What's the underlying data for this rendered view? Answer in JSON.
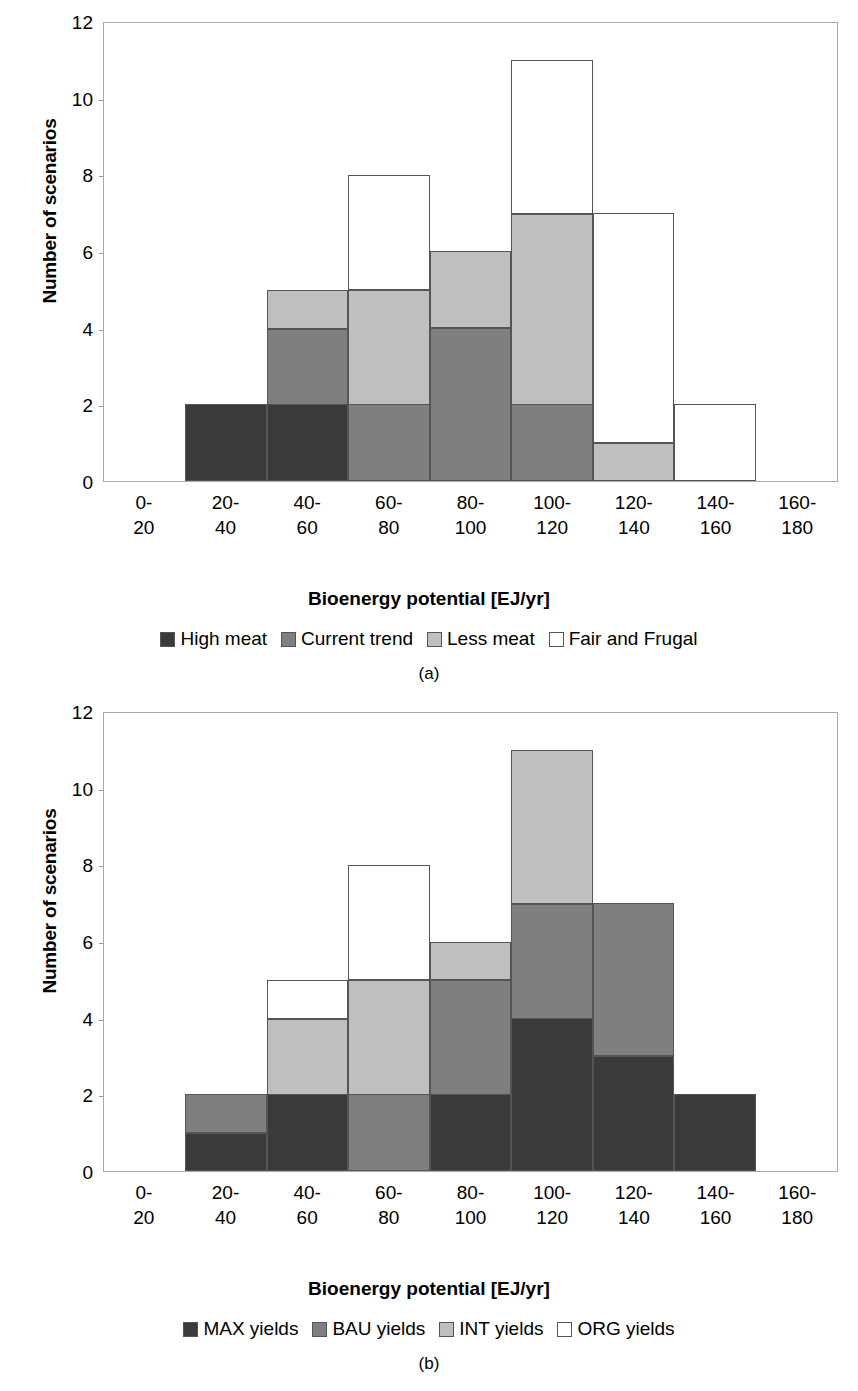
{
  "figures": [
    {
      "id": "a",
      "caption": "(a)",
      "ylabel": "Number of scenarios",
      "xlabel": "Bioenergy potential [EJ/yr]",
      "yticks": [
        "0",
        "2",
        "4",
        "6",
        "8",
        "10",
        "12"
      ],
      "categories": [
        "0-\n20",
        "20-\n40",
        "40-\n60",
        "60-\n80",
        "80-\n100",
        "100-\n120",
        "120-\n140",
        "140-\n160",
        "160-\n180"
      ],
      "legend": [
        {
          "label": "High meat",
          "color": "#3a3a3a"
        },
        {
          "label": "Current trend",
          "color": "#7f7f7f"
        },
        {
          "label": "Less meat",
          "color": "#bfbfbf"
        },
        {
          "label": "Fair and Frugal",
          "color": "#ffffff"
        }
      ]
    },
    {
      "id": "b",
      "caption": "(b)",
      "ylabel": "Number of scenarios",
      "xlabel": "Bioenergy potential [EJ/yr]",
      "yticks": [
        "0",
        "2",
        "4",
        "6",
        "8",
        "10",
        "12"
      ],
      "categories": [
        "0-\n20",
        "20-\n40",
        "40-\n60",
        "60-\n80",
        "80-\n100",
        "100-\n120",
        "120-\n140",
        "140-\n160",
        "160-\n180"
      ],
      "legend": [
        {
          "label": "MAX yields",
          "color": "#3a3a3a"
        },
        {
          "label": "BAU yields",
          "color": "#7f7f7f"
        },
        {
          "label": "INT yields",
          "color": "#bfbfbf"
        },
        {
          "label": "ORG yields",
          "color": "#ffffff"
        }
      ]
    }
  ],
  "chart_data": [
    {
      "type": "bar",
      "title": "(a)",
      "stacked": true,
      "xlabel": "Bioenergy potential [EJ/yr]",
      "ylabel": "Number of scenarios",
      "ylim": [
        0,
        12
      ],
      "ytick_step": 2,
      "grid": false,
      "legend_position": "bottom",
      "categories": [
        "0-20",
        "20-40",
        "40-60",
        "60-80",
        "80-100",
        "100-120",
        "120-140",
        "140-160",
        "160-180"
      ],
      "series": [
        {
          "name": "High meat",
          "color": "#3a3a3a",
          "values": [
            0,
            2,
            2,
            0,
            0,
            0,
            0,
            0,
            0
          ]
        },
        {
          "name": "Current trend",
          "color": "#7f7f7f",
          "values": [
            0,
            0,
            2,
            2,
            4,
            2,
            0,
            0,
            0
          ]
        },
        {
          "name": "Less meat",
          "color": "#bfbfbf",
          "values": [
            0,
            0,
            1,
            3,
            2,
            5,
            1,
            0,
            0
          ]
        },
        {
          "name": "Fair and Frugal",
          "color": "#ffffff",
          "values": [
            0,
            0,
            0,
            3,
            0,
            4,
            6,
            2,
            0
          ]
        }
      ],
      "totals": [
        0,
        2,
        5,
        8,
        6,
        11,
        7,
        2,
        0
      ]
    },
    {
      "type": "bar",
      "title": "(b)",
      "stacked": true,
      "xlabel": "Bioenergy potential [EJ/yr]",
      "ylabel": "Number of scenarios",
      "ylim": [
        0,
        12
      ],
      "ytick_step": 2,
      "grid": false,
      "legend_position": "bottom",
      "categories": [
        "0-20",
        "20-40",
        "40-60",
        "60-80",
        "80-100",
        "100-120",
        "120-140",
        "140-160",
        "160-180"
      ],
      "series": [
        {
          "name": "MAX yields",
          "color": "#3a3a3a",
          "values": [
            0,
            1,
            2,
            0,
            2,
            4,
            3,
            2,
            0
          ]
        },
        {
          "name": "BAU yields",
          "color": "#7f7f7f",
          "values": [
            0,
            1,
            0,
            2,
            3,
            3,
            4,
            0,
            0
          ]
        },
        {
          "name": "INT yields",
          "color": "#bfbfbf",
          "values": [
            0,
            0,
            2,
            3,
            1,
            4,
            0,
            0,
            0
          ]
        },
        {
          "name": "ORG yields",
          "color": "#ffffff",
          "values": [
            0,
            0,
            1,
            3,
            0,
            0,
            0,
            0,
            0
          ]
        }
      ],
      "totals": [
        0,
        2,
        5,
        8,
        6,
        11,
        7,
        2,
        0
      ]
    }
  ]
}
